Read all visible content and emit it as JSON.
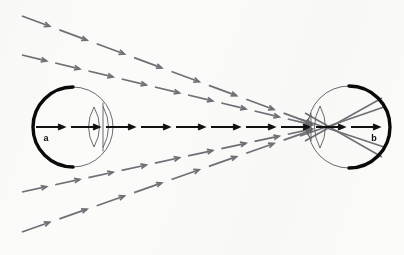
{
  "figure": {
    "background_color": "#fbfbfa",
    "width": 404,
    "height": 255,
    "labels": [
      {
        "id": "a",
        "text": "a",
        "x": 46,
        "y": 141,
        "eye": "left-eye"
      },
      {
        "id": "b",
        "text": "b",
        "x": 374,
        "y": 141,
        "eye": "right-eye"
      }
    ]
  },
  "colors": {
    "ray_gray": "#6f6f75",
    "axis_black": "#111111",
    "eye_outline": "#5a5a60",
    "retina_thick": "#0a0a0a",
    "paper": "#fbfbfa"
  },
  "eyes": [
    {
      "name": "left-eye",
      "label": "a",
      "center_x": 73,
      "center_y": 127,
      "radius": 40,
      "thick_arc_side": "left",
      "cornea_side": "right",
      "lens_x": 94,
      "lens_rx": 11,
      "lens_ry": 20,
      "vertical_line_x": 103
    },
    {
      "name": "right-eye",
      "label": "b",
      "center_x": 349,
      "center_y": 127,
      "radius": 41,
      "thick_arc_side": "right",
      "cornea_side": "left",
      "lens_x": 320,
      "lens_rx": 11,
      "lens_ry": 21,
      "vertical_line_x": 311
    }
  ],
  "axis": {
    "name": "optical-axis",
    "y": 127,
    "x_start": 36,
    "x_end": 386,
    "color": "#111111",
    "segment_count": 10,
    "description": "Horizontal black dashed arrow chain running from eye a through eye b along the optical axis"
  },
  "chart_data": {
    "type": "diagram",
    "xlabel": "",
    "ylabel": "",
    "convergence_point": {
      "x": 321,
      "y": 127
    },
    "ray_bundles": [
      {
        "name": "upper-ray-1",
        "color": "#6f6f75",
        "start": {
          "x": 22,
          "y": 16
        },
        "end": {
          "x": 321,
          "y": 127
        },
        "segments": 8,
        "direction": "down-right"
      },
      {
        "name": "upper-ray-2",
        "color": "#6f6f75",
        "start": {
          "x": 22,
          "y": 55
        },
        "end": {
          "x": 321,
          "y": 127
        },
        "segments": 9,
        "direction": "down-right"
      },
      {
        "name": "lower-ray-1",
        "color": "#6f6f75",
        "start": {
          "x": 22,
          "y": 192
        },
        "end": {
          "x": 321,
          "y": 127
        },
        "segments": 9,
        "direction": "up-right"
      },
      {
        "name": "lower-ray-2",
        "color": "#6f6f75",
        "start": {
          "x": 22,
          "y": 232
        },
        "end": {
          "x": 321,
          "y": 127
        },
        "segments": 8,
        "direction": "up-right"
      }
    ],
    "refracted_rays": [
      {
        "name": "refracted-to-lower-retina",
        "color": "#6f6f75",
        "start": {
          "x": 305,
          "y": 113
        },
        "end": {
          "x": 382,
          "y": 157
        }
      },
      {
        "name": "refracted-to-upper-retina",
        "color": "#6f6f75",
        "start": {
          "x": 305,
          "y": 141
        },
        "end": {
          "x": 382,
          "y": 98
        }
      },
      {
        "name": "refracted-lower-inner",
        "color": "#6f6f75",
        "start": {
          "x": 300,
          "y": 119
        },
        "end": {
          "x": 384,
          "y": 147
        }
      },
      {
        "name": "refracted-upper-inner",
        "color": "#6f6f75",
        "start": {
          "x": 300,
          "y": 136
        },
        "end": {
          "x": 384,
          "y": 107
        }
      }
    ]
  }
}
